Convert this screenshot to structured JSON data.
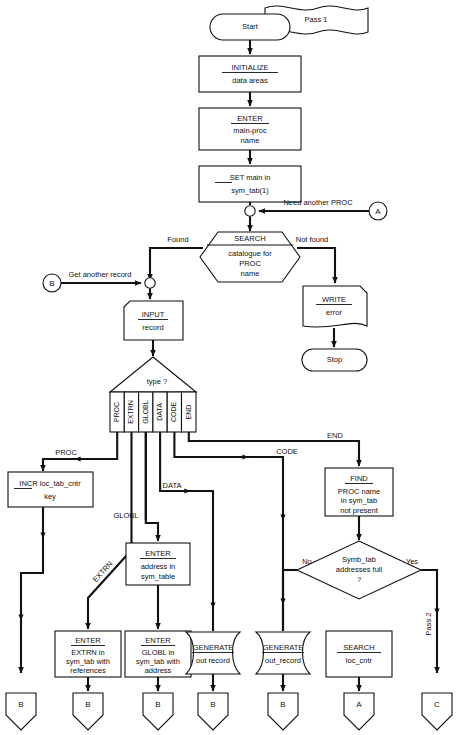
{
  "diagram": {
    "pass_labels": {
      "pass1": "Pass 1",
      "pass2": "Pass 2"
    }
  },
  "nodes": {
    "start": {
      "label": "Start"
    },
    "initialize": {
      "kw": "INITIALIZE",
      "line2": "data areas"
    },
    "enter_main": {
      "kw": "ENTER",
      "line2": "main-proc",
      "line3": "name"
    },
    "set_main": {
      "kw": "SET",
      "rest": " main in",
      "line2": "sym_tab(1)"
    },
    "search_cat": {
      "kw": "SEARCH",
      "line2": "catalogue for",
      "line3": "PROC",
      "line4": "name"
    },
    "write_error": {
      "kw": "WRITE",
      "line2": "error"
    },
    "stop": {
      "label": "Stop"
    },
    "input_record": {
      "kw": "INPUT",
      "line2": "record"
    },
    "type_decision": {
      "label": "type ?"
    },
    "incr": {
      "kw": "INCR",
      "rest": " loc_tab_cntr",
      "line2": "key"
    },
    "enter_address": {
      "kw": "ENTER",
      "line2": "address in",
      "line3": "sym_table"
    },
    "find_proc": {
      "kw": "FIND",
      "line2": "PROC name",
      "line3": "in sym_tab",
      "line4": "not present"
    },
    "symb_full": {
      "line1": "Symb_tab",
      "line2": "addresses full",
      "line3": "?"
    },
    "enter_extrn": {
      "kw": "ENTER",
      "line2": "EXTRN in",
      "line3": "sym_tab with",
      "line4": "references"
    },
    "enter_globl": {
      "kw": "ENTER",
      "line2": "GLOBL in",
      "line3": "sym_tab with",
      "line4": "address"
    },
    "generate_out_record": {
      "kw": "GENERATE",
      "line2": "out record"
    },
    "generate_out_record2": {
      "kw": "GENERATE",
      "line2": "out_record"
    },
    "search_loc_cntr": {
      "kw": "SEARCH",
      "line2": "loc_cntr"
    }
  },
  "connectors": {
    "a_in": "A",
    "b_in": "B",
    "b1": "B",
    "b2": "B",
    "b3": "B",
    "b4": "B",
    "b5": "B",
    "a_out": "A",
    "c_out": "C"
  },
  "edge_labels": {
    "need_another_proc": "Need another PROC",
    "get_another_record": "Get another record",
    "found": "Found",
    "not_found": "Not found",
    "proc": "PROC",
    "data": "DATA",
    "globl": "GLOBL",
    "extrn": "EXTRN",
    "code": "CODE",
    "end": "END",
    "no": "No",
    "yes": "Yes"
  },
  "type_branches": [
    "PROC",
    "EXTRN",
    "GLOBL",
    "DATA",
    "CODE",
    "END"
  ],
  "colors": {
    "ink": "#111111",
    "paper": "#ffffff"
  }
}
